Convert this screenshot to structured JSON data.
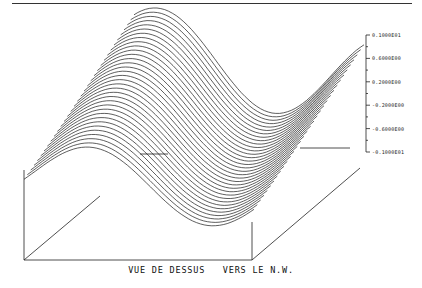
{
  "chart_data": {
    "type": "surface3d",
    "title": "",
    "caption": "VUE DE DESSUS   VERS LE N.W.",
    "zaxis": {
      "position": "right",
      "ticks": [
        "0.1000E01",
        "0.6000E00",
        "0.2000E00",
        "-0.2000E00",
        "-0.6000E00",
        "-0.1000E01"
      ],
      "tick_values": [
        1.0,
        0.6,
        0.2,
        -0.2,
        -0.6,
        -1.0
      ],
      "range": [
        -1.0,
        1.0
      ],
      "minor_ticks_between": 1
    },
    "surface": {
      "function_hint": "z = sin(k*(x + a*y)) wave surface, amplitude 1",
      "n_profiles": 34,
      "amplitude": 1.0
    },
    "grid": false,
    "legend": null
  },
  "page": {
    "caption": "VUE DE DESSUS   VERS LE N.W."
  }
}
